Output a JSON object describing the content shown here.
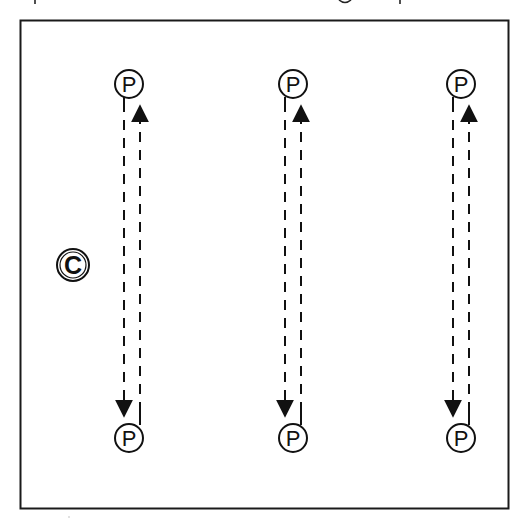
{
  "diagram": {
    "title": "",
    "frame": {
      "x": 20,
      "y": 20,
      "width": 489,
      "height": 489,
      "stroke": "#1a1a1a"
    },
    "coach": {
      "label": "C",
      "cx": 73,
      "cy": 265,
      "r": 16
    },
    "player_label": "P",
    "columns": [
      {
        "id": "left",
        "cx": 129,
        "top_cy": 84,
        "bottom_cy": 438
      },
      {
        "id": "middle",
        "cx": 293,
        "top_cy": 84,
        "bottom_cy": 438
      },
      {
        "id": "right",
        "cx": 461,
        "top_cy": 84,
        "bottom_cy": 438
      }
    ],
    "paths": {
      "down": "Player runs from top cone down to bottom cone (dashed, arrow down)",
      "up": "Player runs from bottom cone back up to top cone (dashed, arrow up)"
    },
    "colors": {
      "ink": "#111111",
      "background": "#ffffff"
    }
  }
}
